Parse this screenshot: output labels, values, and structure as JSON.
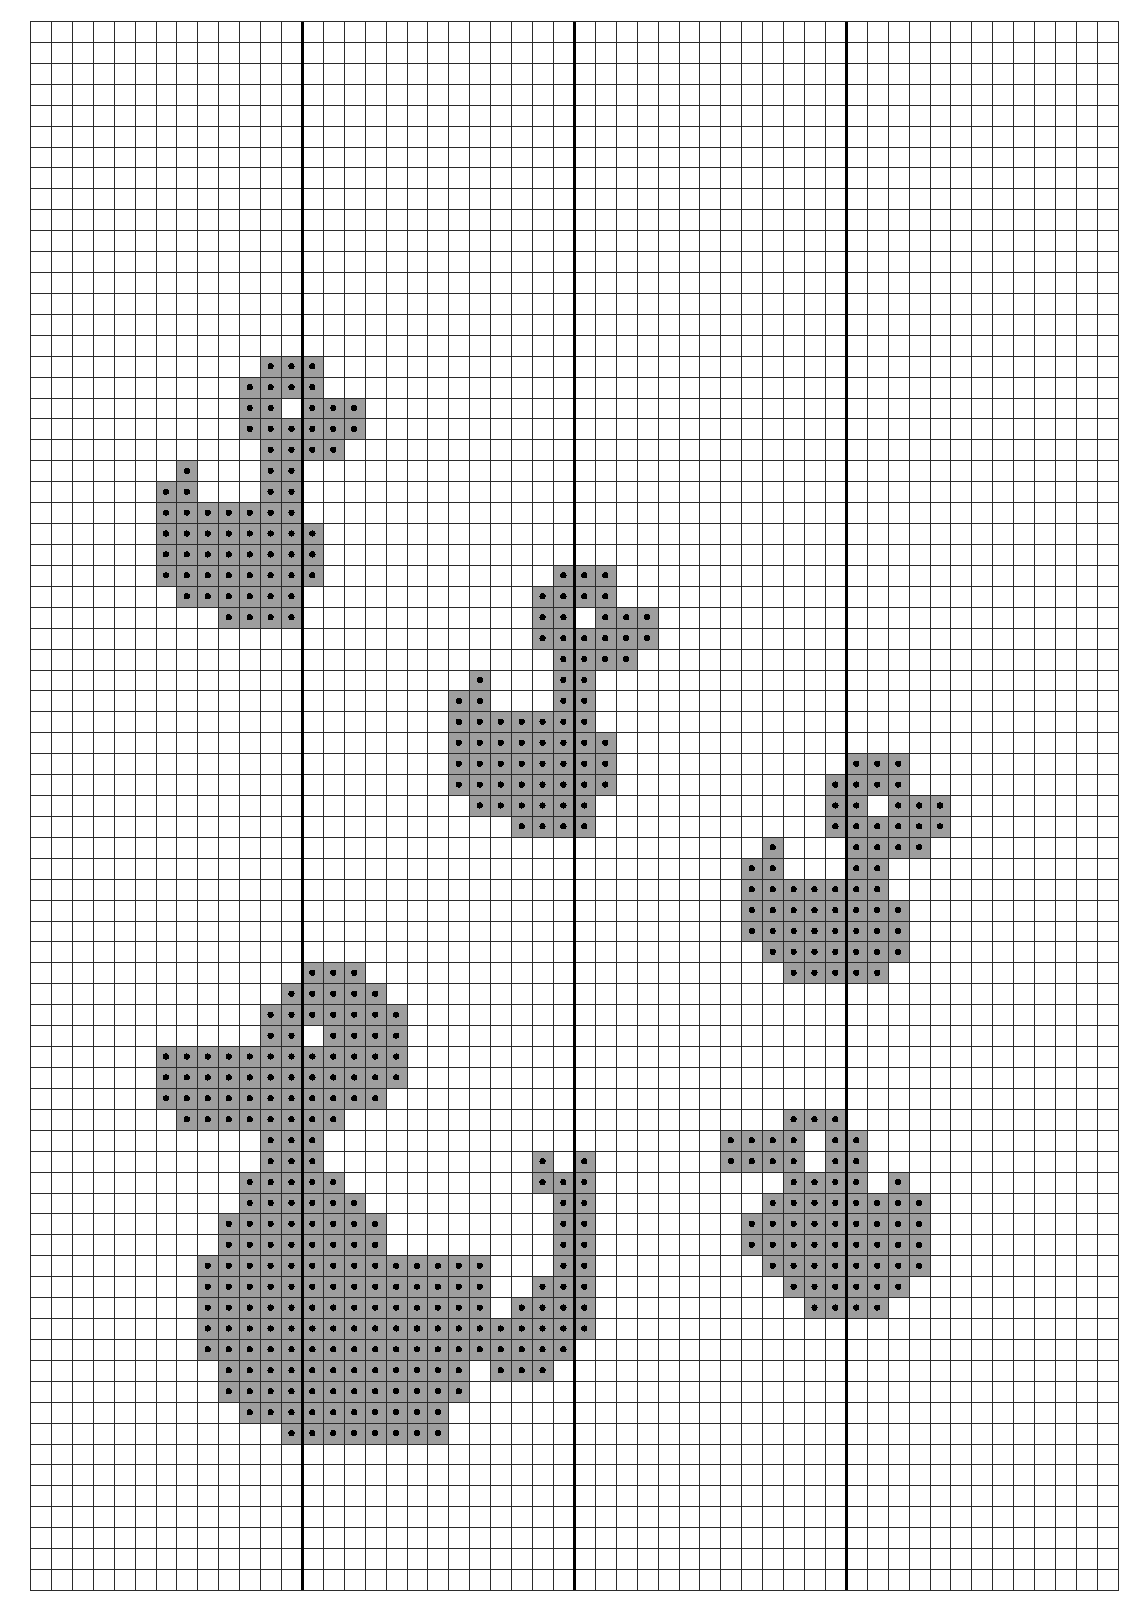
{
  "document": {
    "type": "cross-stitch-pattern-chart",
    "title": "Cross Stitch Pattern Chart",
    "page_width": 1142,
    "page_height": 1613
  },
  "grid": {
    "origin_x": 30,
    "origin_y": 21,
    "cell_size": 20.92,
    "columns": 52,
    "rows": 75,
    "thin_line_color": "#2b2b2b",
    "thin_line_width": 1.2,
    "bold_line_color": "#000000",
    "bold_line_width": 3.4,
    "bold_column_interval": 13,
    "bold_columns": [
      13,
      26,
      39
    ],
    "bold_rows": [],
    "background_color": "#ffffff"
  },
  "symbols": {
    "filled": {
      "name": "gray-square-with-dot",
      "fill_color": "#9e9e9e",
      "dot_color": "#000000",
      "dot_radius": 3.1,
      "outline_color": "#2b2b2b",
      "description": "Shaded square containing a centered black dot (one floss colour)"
    },
    "empty": {
      "name": "blank-cell",
      "fill_color": "#ffffff",
      "description": "Unstitched fabric"
    }
  },
  "chart_data": {
    "type": "heatmap",
    "xlabel": "",
    "ylabel": "",
    "grid": true,
    "legend": [],
    "categories": [],
    "values": [],
    "columns": 52,
    "rows": 75,
    "cell_states": [
      "empty",
      "filled"
    ],
    "motifs": [
      {
        "name": "motif-top-left",
        "anchor_col": 6,
        "anchor_row": 16
      },
      {
        "name": "motif-middle",
        "anchor_col": 20,
        "anchor_row": 26
      },
      {
        "name": "motif-right",
        "anchor_col": 33,
        "anchor_row": 35
      },
      {
        "name": "motif-bottom-left",
        "anchor_col": 6,
        "anchor_row": 45
      },
      {
        "name": "motif-bottom-right",
        "anchor_col": 33,
        "anchor_row": 52
      }
    ],
    "filled_rows": [
      {
        "row": 16,
        "cols": [
          11,
          12,
          13
        ]
      },
      {
        "row": 17,
        "cols": [
          10,
          11,
          12,
          13
        ]
      },
      {
        "row": 18,
        "cols": [
          10,
          11,
          13,
          14,
          15
        ]
      },
      {
        "row": 19,
        "cols": [
          10,
          11,
          12,
          13,
          14,
          15
        ]
      },
      {
        "row": 20,
        "cols": [
          11,
          12,
          13,
          14
        ]
      },
      {
        "row": 21,
        "cols": [
          7,
          11,
          12
        ]
      },
      {
        "row": 22,
        "cols": [
          6,
          7,
          11,
          12
        ]
      },
      {
        "row": 23,
        "cols": [
          6,
          7,
          8,
          9,
          10,
          11,
          12
        ]
      },
      {
        "row": 24,
        "cols": [
          6,
          7,
          8,
          9,
          10,
          11,
          12,
          13
        ]
      },
      {
        "row": 25,
        "cols": [
          6,
          7,
          8,
          9,
          10,
          11,
          12,
          13
        ]
      },
      {
        "row": 26,
        "cols": [
          6,
          7,
          8,
          9,
          10,
          11,
          12,
          13
        ]
      },
      {
        "row": 27,
        "cols": [
          7,
          8,
          9,
          10,
          11,
          12
        ]
      },
      {
        "row": 28,
        "cols": [
          9,
          10,
          11,
          12
        ]
      },
      {
        "row": 26,
        "cols": [
          25,
          26,
          27
        ]
      },
      {
        "row": 27,
        "cols": [
          24,
          25,
          26,
          27
        ]
      },
      {
        "row": 28,
        "cols": [
          24,
          25,
          27,
          28,
          29
        ]
      },
      {
        "row": 29,
        "cols": [
          24,
          25,
          26,
          27,
          28,
          29
        ]
      },
      {
        "row": 30,
        "cols": [
          25,
          26,
          27,
          28
        ]
      },
      {
        "row": 31,
        "cols": [
          21,
          25,
          26
        ]
      },
      {
        "row": 32,
        "cols": [
          20,
          21,
          25,
          26
        ]
      },
      {
        "row": 33,
        "cols": [
          20,
          21,
          22,
          23,
          24,
          25,
          26
        ]
      },
      {
        "row": 34,
        "cols": [
          20,
          21,
          22,
          23,
          24,
          25,
          26,
          27
        ]
      },
      {
        "row": 35,
        "cols": [
          20,
          21,
          22,
          23,
          24,
          25,
          26,
          27
        ]
      },
      {
        "row": 36,
        "cols": [
          20,
          21,
          22,
          23,
          24,
          25,
          26,
          27
        ]
      },
      {
        "row": 37,
        "cols": [
          21,
          22,
          23,
          24,
          25,
          26
        ]
      },
      {
        "row": 38,
        "cols": [
          23,
          24,
          25,
          26
        ]
      },
      {
        "row": 35,
        "cols": [
          39,
          40,
          41
        ]
      },
      {
        "row": 36,
        "cols": [
          38,
          39,
          40,
          41
        ]
      },
      {
        "row": 37,
        "cols": [
          38,
          39,
          41,
          42,
          43
        ]
      },
      {
        "row": 38,
        "cols": [
          38,
          39,
          40,
          41,
          42,
          43
        ]
      },
      {
        "row": 39,
        "cols": [
          35,
          39,
          40,
          41,
          42
        ]
      },
      {
        "row": 40,
        "cols": [
          34,
          35,
          39,
          40
        ]
      },
      {
        "row": 41,
        "cols": [
          34,
          35,
          36,
          37,
          38,
          39,
          40
        ]
      },
      {
        "row": 42,
        "cols": [
          34,
          35,
          36,
          37,
          38,
          39,
          40,
          41
        ]
      },
      {
        "row": 43,
        "cols": [
          34,
          35,
          36,
          37,
          38,
          39,
          40,
          41
        ]
      },
      {
        "row": 44,
        "cols": [
          35,
          36,
          37,
          38,
          39,
          40,
          41
        ]
      },
      {
        "row": 45,
        "cols": [
          36,
          37,
          38,
          39,
          40
        ]
      },
      {
        "row": 45,
        "cols": [
          13,
          14,
          15
        ]
      },
      {
        "row": 46,
        "cols": [
          12,
          13,
          14,
          15,
          16
        ]
      },
      {
        "row": 47,
        "cols": [
          11,
          12,
          13,
          14,
          15,
          16,
          17
        ]
      },
      {
        "row": 48,
        "cols": [
          11,
          12,
          14,
          15,
          16,
          17
        ]
      },
      {
        "row": 49,
        "cols": [
          6,
          7,
          8,
          9,
          10,
          11,
          12,
          13,
          14,
          15,
          16,
          17
        ]
      },
      {
        "row": 50,
        "cols": [
          6,
          7,
          8,
          9,
          10,
          11,
          12,
          13,
          14,
          15,
          16,
          17
        ]
      },
      {
        "row": 51,
        "cols": [
          6,
          7,
          8,
          9,
          10,
          11,
          12,
          13,
          14,
          15,
          16
        ]
      },
      {
        "row": 52,
        "cols": [
          7,
          8,
          9,
          10,
          11,
          12,
          13,
          14
        ]
      },
      {
        "row": 53,
        "cols": [
          11,
          12,
          13
        ]
      },
      {
        "row": 54,
        "cols": [
          11,
          12,
          13
        ]
      },
      {
        "row": 55,
        "cols": [
          10,
          11,
          12,
          13,
          14
        ]
      },
      {
        "row": 56,
        "cols": [
          10,
          11,
          12,
          13,
          14,
          15
        ]
      },
      {
        "row": 57,
        "cols": [
          9,
          10,
          11,
          12,
          13,
          14,
          15,
          16
        ]
      },
      {
        "row": 58,
        "cols": [
          9,
          10,
          11,
          12,
          13,
          14,
          15,
          16
        ]
      },
      {
        "row": 59,
        "cols": [
          8,
          9,
          10,
          11,
          12,
          13,
          14,
          15,
          16,
          17,
          18,
          19,
          20,
          21
        ]
      },
      {
        "row": 60,
        "cols": [
          8,
          9,
          10,
          11,
          12,
          13,
          14,
          15,
          16,
          17,
          18,
          19,
          20,
          21
        ]
      },
      {
        "row": 61,
        "cols": [
          8,
          9,
          10,
          11,
          12,
          13,
          14,
          15,
          16,
          17,
          18,
          19,
          20,
          21
        ]
      },
      {
        "row": 62,
        "cols": [
          8,
          9,
          10,
          11,
          12,
          13,
          14,
          15,
          16,
          17,
          18,
          19,
          20,
          21
        ]
      },
      {
        "row": 63,
        "cols": [
          8,
          9,
          10,
          11,
          12,
          13,
          14,
          15,
          16,
          17,
          18,
          19,
          20,
          21
        ]
      },
      {
        "row": 64,
        "cols": [
          9,
          10,
          11,
          12,
          13,
          14,
          15,
          16,
          17,
          18,
          19,
          20
        ]
      },
      {
        "row": 65,
        "cols": [
          9,
          10,
          11,
          12,
          13,
          14,
          15,
          16,
          17,
          18,
          19,
          20
        ]
      },
      {
        "row": 66,
        "cols": [
          10,
          11,
          12,
          13,
          14,
          15,
          16,
          17,
          18,
          19
        ]
      },
      {
        "row": 67,
        "cols": [
          12,
          13,
          14,
          15,
          16,
          17,
          18,
          19
        ]
      },
      {
        "row": 54,
        "cols": [
          24,
          26
        ]
      },
      {
        "row": 55,
        "cols": [
          24,
          25,
          26
        ]
      },
      {
        "row": 56,
        "cols": [
          25,
          26
        ]
      },
      {
        "row": 57,
        "cols": [
          25,
          26
        ]
      },
      {
        "row": 58,
        "cols": [
          25,
          26
        ]
      },
      {
        "row": 59,
        "cols": [
          25,
          26
        ]
      },
      {
        "row": 60,
        "cols": [
          24,
          25,
          26
        ]
      },
      {
        "row": 61,
        "cols": [
          23,
          24,
          25,
          26
        ]
      },
      {
        "row": 62,
        "cols": [
          22,
          23,
          24,
          25,
          26
        ]
      },
      {
        "row": 63,
        "cols": [
          22,
          23,
          24,
          25
        ]
      },
      {
        "row": 64,
        "cols": [
          22,
          23,
          24
        ]
      },
      {
        "row": 52,
        "cols": [
          36,
          37,
          38
        ]
      },
      {
        "row": 53,
        "cols": [
          33,
          34,
          35,
          36,
          38,
          39
        ]
      },
      {
        "row": 54,
        "cols": [
          33,
          34,
          35,
          36,
          38,
          39
        ]
      },
      {
        "row": 55,
        "cols": [
          36,
          37,
          38,
          39,
          41
        ]
      },
      {
        "row": 56,
        "cols": [
          35,
          36,
          37,
          38,
          39,
          40,
          41,
          42
        ]
      },
      {
        "row": 57,
        "cols": [
          34,
          35,
          36,
          37,
          38,
          39,
          40,
          41,
          42
        ]
      },
      {
        "row": 58,
        "cols": [
          34,
          35,
          36,
          37,
          38,
          39,
          40,
          41,
          42
        ]
      },
      {
        "row": 59,
        "cols": [
          35,
          36,
          37,
          38,
          39,
          40,
          41,
          42
        ]
      },
      {
        "row": 60,
        "cols": [
          36,
          37,
          38,
          39,
          40,
          41
        ]
      },
      {
        "row": 61,
        "cols": [
          37,
          38,
          39,
          40
        ]
      }
    ]
  }
}
